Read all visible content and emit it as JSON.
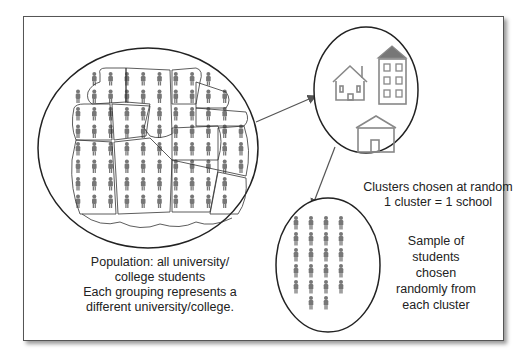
{
  "diagram": {
    "population_label": [
      "Population: all university/",
      "college students",
      "Each grouping represents a",
      "different university/college."
    ],
    "clusters_label": [
      "Clusters chosen at random",
      "1 cluster = 1 school"
    ],
    "sample_label": [
      "Sample of",
      "students",
      "chosen",
      "randomly from",
      "each cluster"
    ],
    "nodes": [
      {
        "id": "population",
        "shape": "circle",
        "content": "grid of student figures grouped into irregular clusters"
      },
      {
        "id": "chosen-clusters",
        "shape": "circle",
        "content": "three school buildings"
      },
      {
        "id": "sample",
        "shape": "circle",
        "content": "22 student figures"
      }
    ],
    "edges": [
      {
        "from": "population",
        "to": "chosen-clusters"
      },
      {
        "from": "chosen-clusters",
        "to": "sample"
      }
    ],
    "colors": {
      "line": "#222222",
      "figure": "#777777",
      "building": "#888888",
      "roof_fill": "#777777"
    }
  }
}
